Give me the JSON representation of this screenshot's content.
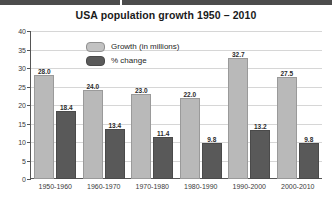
{
  "chart_data": {
    "type": "bar",
    "title": "USA population growth 1950 – 2010",
    "xlabel": "",
    "ylabel": "",
    "ylim": [
      0,
      40
    ],
    "yticks": [
      0,
      5,
      10,
      15,
      20,
      25,
      30,
      35,
      40
    ],
    "grid": true,
    "legend_position": "upper-left-inside",
    "categories": [
      "1950-1960",
      "1960-1970",
      "1970-1980",
      "1980-1990",
      "1990-2000",
      "2000-2010"
    ],
    "series": [
      {
        "name": "Growth (in millions)",
        "color": "#b9b9b9",
        "values": [
          28.0,
          24.0,
          23.0,
          22.0,
          32.7,
          27.5
        ],
        "labels": [
          "28.0",
          "24.0",
          "23.0",
          "22.0",
          "32.7",
          "27.5"
        ]
      },
      {
        "name": "% change",
        "color": "#595959",
        "values": [
          18.4,
          13.4,
          11.4,
          9.8,
          13.2,
          9.8
        ],
        "labels": [
          "18.4",
          "13.4",
          "11.4",
          "9.8",
          "13.2",
          "9.8"
        ]
      }
    ]
  },
  "colors": {
    "growth_bar": "#b9b9b9",
    "change_bar": "#595959",
    "gridline": "#d6d6d6",
    "axis": "#555555",
    "text": "#262626",
    "topbar": "#4c4c4c",
    "background": "#ffffff"
  }
}
